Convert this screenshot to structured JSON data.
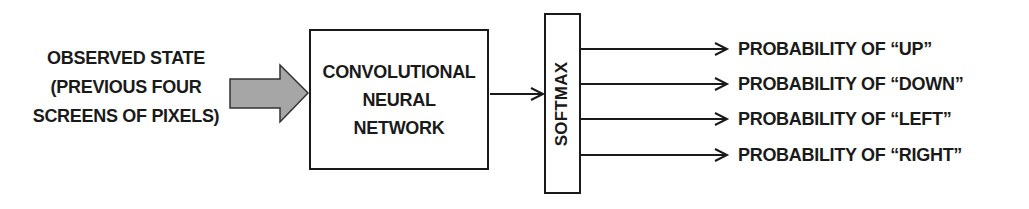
{
  "diagram": {
    "type": "flow",
    "input": {
      "lines": [
        "OBSERVED STATE",
        "(PREVIOUS FOUR",
        "SCREENS OF PIXELS)"
      ]
    },
    "input_arrow": {
      "fill": "#a6a6a6",
      "stroke": "#333333"
    },
    "cnn": {
      "lines": [
        "CONVOLUTIONAL",
        "NEURAL",
        "NETWORK"
      ]
    },
    "softmax": {
      "label": "SOFTMAX"
    },
    "outputs": [
      {
        "label": "PROBABILITY OF  “UP”"
      },
      {
        "label": "PROBABILITY OF  “DOWN”"
      },
      {
        "label": "PROBABILITY OF  “LEFT”"
      },
      {
        "label": "PROBABILITY OF  “RIGHT”"
      }
    ],
    "colors": {
      "line": "#1a1a1a",
      "background": "#ffffff"
    }
  }
}
